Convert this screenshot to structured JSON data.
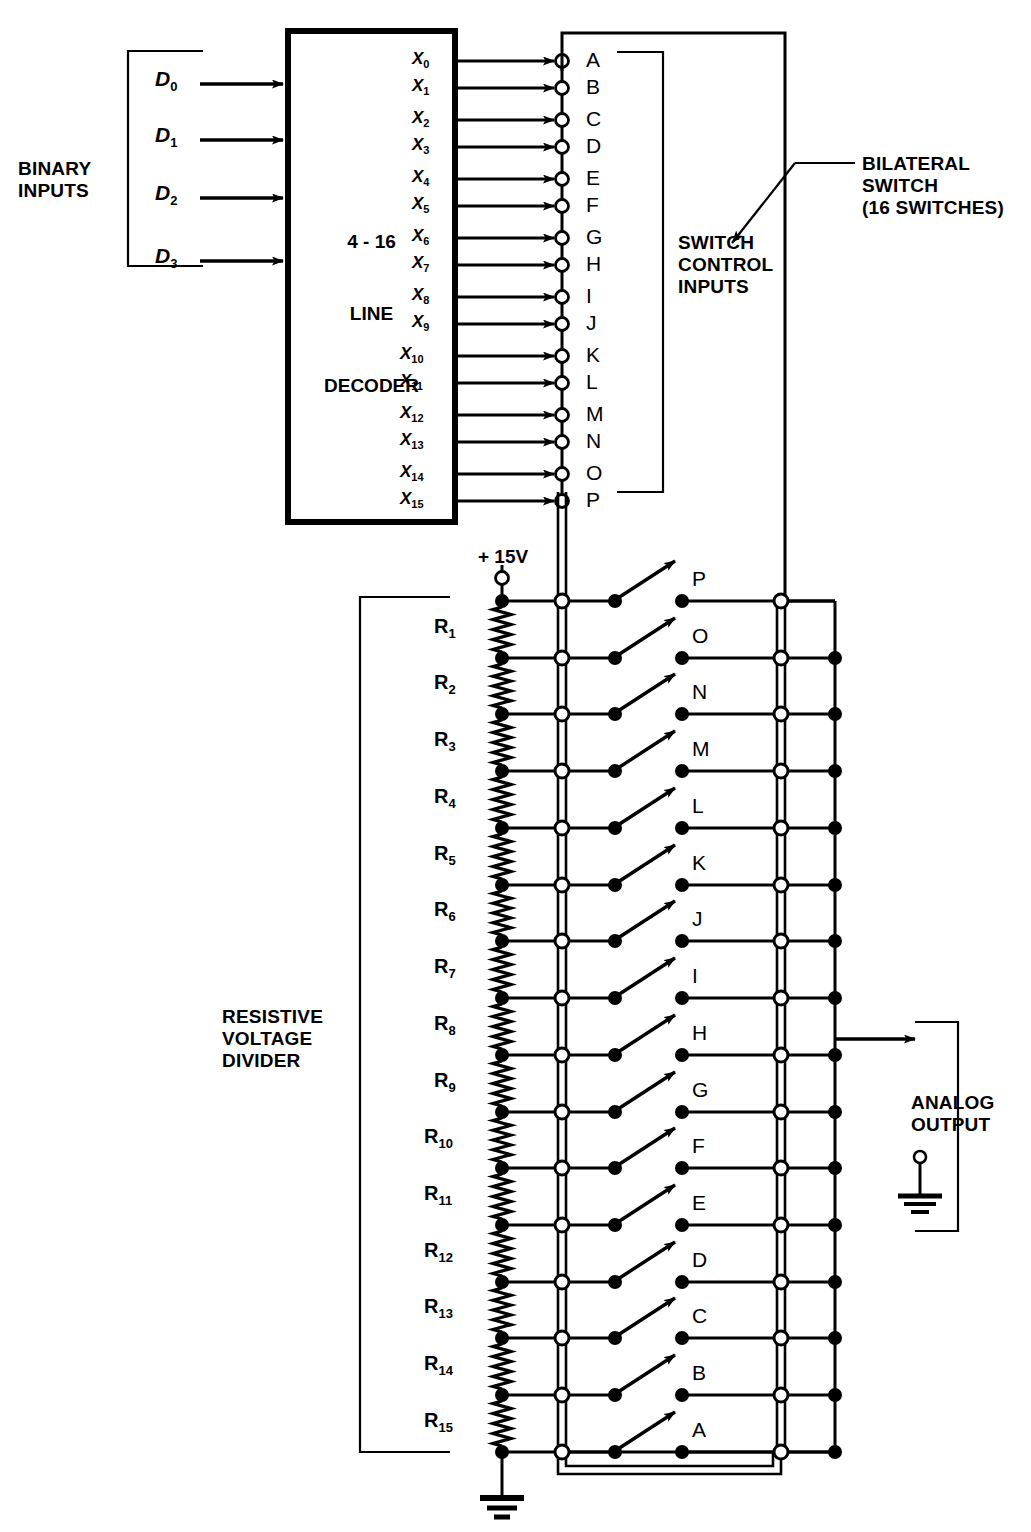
{
  "diagram": {
    "decoder": {
      "line1": "4 - 16",
      "line2": "LINE",
      "line3": "DECODER",
      "inputs": [
        "D0",
        "D1",
        "D2",
        "D3"
      ],
      "input_labels": [
        {
          "base": "D",
          "sub": "0"
        },
        {
          "base": "D",
          "sub": "1"
        },
        {
          "base": "D",
          "sub": "2"
        },
        {
          "base": "D",
          "sub": "3"
        }
      ],
      "outputs": [
        {
          "base": "X",
          "sub": "0"
        },
        {
          "base": "X",
          "sub": "1"
        },
        {
          "base": "X",
          "sub": "2"
        },
        {
          "base": "X",
          "sub": "3"
        },
        {
          "base": "X",
          "sub": "4"
        },
        {
          "base": "X",
          "sub": "5"
        },
        {
          "base": "X",
          "sub": "6"
        },
        {
          "base": "X",
          "sub": "7"
        },
        {
          "base": "X",
          "sub": "8"
        },
        {
          "base": "X",
          "sub": "9"
        },
        {
          "base": "X",
          "sub": "10"
        },
        {
          "base": "X",
          "sub": "11"
        },
        {
          "base": "X",
          "sub": "12"
        },
        {
          "base": "X",
          "sub": "13"
        },
        {
          "base": "X",
          "sub": "14"
        },
        {
          "base": "X",
          "sub": "15"
        }
      ]
    },
    "labels": {
      "binary_inputs": "BINARY\nINPUTS",
      "switch_control_inputs": "SWITCH\nCONTROL\nINPUTS",
      "bilateral_switch": "BILATERAL\nSWITCH\n(16 SWITCHES)",
      "resistive_voltage_divider": "RESISTIVE\nVOLTAGE\nDIVIDER",
      "analog_output": "ANALOG\nOUTPUT",
      "supply": "+ 15V"
    },
    "control_nodes": [
      "A",
      "B",
      "C",
      "D",
      "E",
      "F",
      "G",
      "H",
      "I",
      "J",
      "K",
      "L",
      "M",
      "N",
      "O",
      "P"
    ],
    "switch_letters_top_to_bottom": [
      "P",
      "O",
      "N",
      "M",
      "L",
      "K",
      "J",
      "I",
      "H",
      "G",
      "F",
      "E",
      "D",
      "C",
      "B",
      "A"
    ],
    "resistors": [
      {
        "base": "R",
        "sub": "1"
      },
      {
        "base": "R",
        "sub": "2"
      },
      {
        "base": "R",
        "sub": "3"
      },
      {
        "base": "R",
        "sub": "4"
      },
      {
        "base": "R",
        "sub": "5"
      },
      {
        "base": "R",
        "sub": "6"
      },
      {
        "base": "R",
        "sub": "7"
      },
      {
        "base": "R",
        "sub": "8"
      },
      {
        "base": "R",
        "sub": "9"
      },
      {
        "base": "R",
        "sub": "10"
      },
      {
        "base": "R",
        "sub": "11"
      },
      {
        "base": "R",
        "sub": "12"
      },
      {
        "base": "R",
        "sub": "13"
      },
      {
        "base": "R",
        "sub": "14"
      },
      {
        "base": "R",
        "sub": "15"
      }
    ],
    "colors": {
      "line": "#000000",
      "background": "#ffffff",
      "node_open": "#ffffff"
    }
  }
}
